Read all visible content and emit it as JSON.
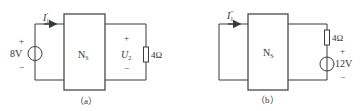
{
  "figure": {
    "colors": {
      "line": "#3a3a3a",
      "text": "#333333",
      "background": "#ffffff"
    },
    "circuits": [
      {
        "id": "a",
        "caption": "（a）",
        "network_label": "N",
        "network_subscript": "S",
        "current_label": "I",
        "current_subscript": "1",
        "current_prime": "′",
        "source": {
          "value": "8V",
          "plus": "+",
          "minus": "−"
        },
        "voltage": {
          "label": "U",
          "subscript": "2",
          "plus": "+",
          "minus": "−"
        },
        "resistor": {
          "value": "4Ω"
        }
      },
      {
        "id": "b",
        "caption": "（b）",
        "network_label": "N",
        "network_subscript": "S",
        "current_label": "I",
        "current_subscript": "1",
        "current_prime": "″",
        "resistor": {
          "value": "4Ω"
        },
        "source": {
          "value": "12V",
          "plus": "+",
          "minus": "−"
        }
      }
    ]
  }
}
